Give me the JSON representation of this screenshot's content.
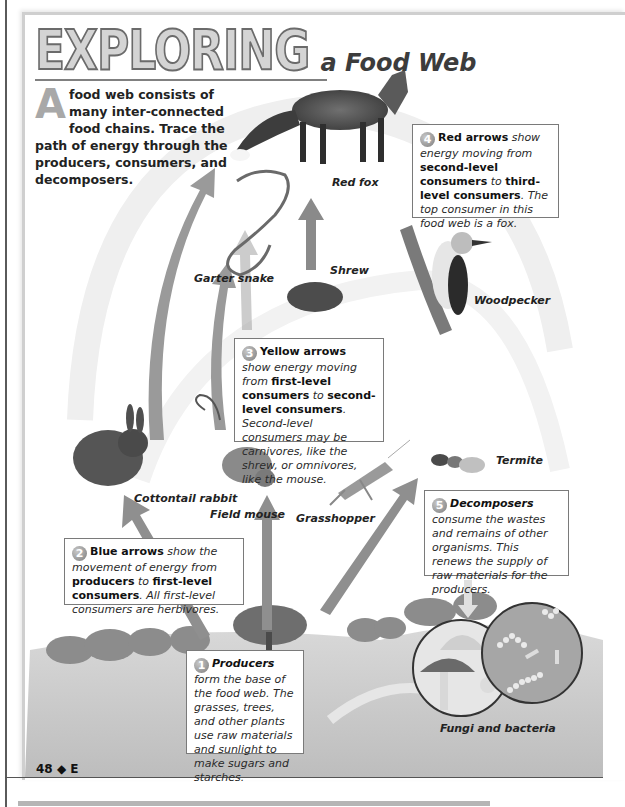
{
  "header": {
    "title_main": "EXPLORING",
    "title_sub": "a Food Web"
  },
  "intro": {
    "dropcap": "A",
    "text": "food web consists of many inter-connected food chains. Trace the path of energy through the producers, consumers, and decomposers."
  },
  "callouts": [
    {
      "number": "1",
      "lead": "Producers",
      "text": " form the base of the food web. The grasses, trees, and other plants use raw materials and sunlight to make sugars and starches."
    },
    {
      "number": "2",
      "lead": "Blue arrows",
      "text_a": " show the movement of energy from ",
      "bold_a": "producers",
      "text_b": " to ",
      "bold_b": "first-level consumers",
      "text_c": ". All first-level consumers are herbivores."
    },
    {
      "number": "3",
      "lead": "Yellow arrows",
      "text_a": " show energy moving from ",
      "bold_a": "first-level consumers",
      "text_b": " to ",
      "bold_b": "second-level consumers",
      "text_c": ". Second-level consumers may be carnivores, like the shrew, or omnivores, like the mouse."
    },
    {
      "number": "4",
      "lead": "Red arrows",
      "text_a": " show energy moving from ",
      "bold_a": "second-level consumers",
      "text_b": " to ",
      "bold_b": "third-level consumers",
      "text_c": ". The top consumer in this food web is a fox."
    },
    {
      "number": "5",
      "lead": "Decomposers",
      "text": " consume the wastes and remains of other organisms. This renews the supply of raw materials for the producers."
    }
  ],
  "organisms": {
    "red_fox": "Red fox",
    "garter_snake": "Garter snake",
    "shrew": "Shrew",
    "woodpecker": "Woodpecker",
    "cottontail_rabbit": "Cottontail rabbit",
    "field_mouse": "Field mouse",
    "grasshopper": "Grasshopper",
    "termite": "Termite",
    "fungi_bacteria": "Fungi and bacteria"
  },
  "footer": {
    "folio": "48 ◆ E"
  }
}
